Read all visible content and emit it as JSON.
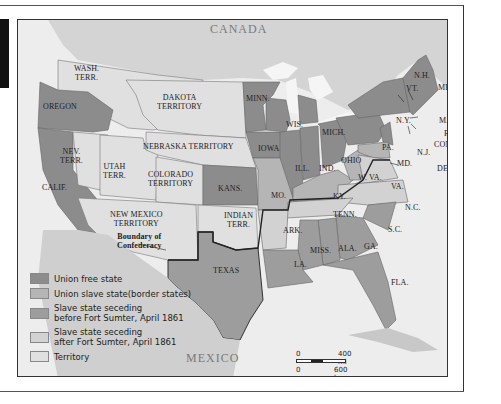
{
  "map": {
    "title_regions": {
      "canada": "CANADA",
      "mexico": "MEXICO"
    },
    "territories": {
      "wash": [
        "WASH.",
        "TERR."
      ],
      "dakota": [
        "DAKOTA",
        "TERRITORY"
      ],
      "nebraska": "NEBRASKA TERRITORY",
      "nevada": [
        "NEV.",
        "TERR."
      ],
      "utah": [
        "UTAH",
        "TERR."
      ],
      "colorado": [
        "COLORADO",
        "TERRITORY"
      ],
      "new_mexico": [
        "NEW MEXICO",
        "TERRITORY"
      ],
      "indian": [
        "INDIAN",
        "TERR."
      ]
    },
    "states": {
      "oregon": "OREGON",
      "calif": "CALIF.",
      "kans": "KANS.",
      "minn": "MINN.",
      "iowa": "IOWA",
      "wis": "WIS.",
      "mich": "MICH.",
      "ill": "ILL.",
      "ind": "IND.",
      "ohio": "OHIO",
      "mo": "MO.",
      "ky": "KY.",
      "wva": "W. VA.",
      "va": "VA.",
      "pa": "PA.",
      "ny": "N.Y.",
      "nj": "N.J.",
      "md": "MD.",
      "del": "DEL.",
      "vt": "VT.",
      "nh": "N.H.",
      "me": "ME.",
      "mass": "MASS.",
      "ri": "R.I.",
      "conn": "CONN.",
      "nc": "N.C.",
      "tenn": "TENN.",
      "ark": "ARK.",
      "sc": "S.C.",
      "ga": "GA.",
      "ala": "ALA.",
      "miss": "MISS.",
      "la": "LA.",
      "fla": "FLA.",
      "texas": "TEXAS"
    },
    "annotation": [
      "Boundary of",
      "Confederacy"
    ]
  },
  "legend": [
    {
      "label": "Union free state",
      "color": "#8c8c8c"
    },
    {
      "label": "Union slave state(border states)",
      "color": "#b5b5b5"
    },
    {
      "label": [
        "Slave state seceding",
        "before Fort Sumter, April 1861"
      ],
      "color": "#9d9d9d"
    },
    {
      "label": [
        "Slave state seceding",
        "after Fort Sumter, April 1861"
      ],
      "color": "#d2d2d2"
    },
    {
      "label": "Territory",
      "color": "#e0e0e0"
    }
  ],
  "scale": {
    "mi_start": "0",
    "mi_end": "400 mi",
    "km_start": "0",
    "km_end": "600 km"
  },
  "colors": {
    "union_free": "#8c8c8c",
    "border": "#b5b5b5",
    "seceded_before": "#9d9d9d",
    "seceded_after": "#d2d2d2",
    "territory": "#e0e0e0",
    "water": "#f2f2f2",
    "foreign_land": "#cfcfcf"
  }
}
